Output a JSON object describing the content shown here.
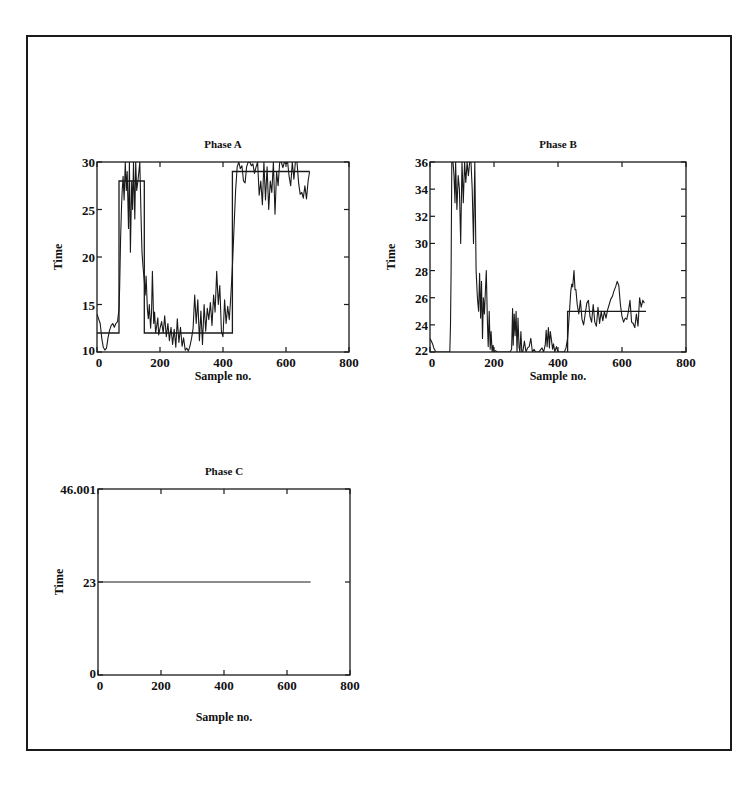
{
  "page": {
    "figure_title_partial": "Figure: Phase responses"
  },
  "chart_data": [
    {
      "type": "line",
      "id": "phaseA",
      "title": "Phase A",
      "xlabel": "Sample no.",
      "ylabel": "Time",
      "xlim": [
        0,
        800
      ],
      "ylim": [
        10,
        30
      ],
      "xticks": [
        0,
        200,
        400,
        600,
        800
      ],
      "yticks": [
        10,
        15,
        20,
        25,
        30
      ],
      "grid": false,
      "box": {
        "x0": 97,
        "y0": 162,
        "x1": 349,
        "y1": 352
      },
      "series": [
        {
          "name": "measured",
          "style": "noisy",
          "x": [
            0,
            5,
            10,
            15,
            20,
            25,
            30,
            35,
            40,
            45,
            50,
            55,
            60,
            65,
            70,
            72,
            75,
            78,
            80,
            83,
            86,
            90,
            93,
            96,
            100,
            103,
            106,
            110,
            113,
            116,
            120,
            123,
            126,
            130,
            133,
            136,
            140,
            143,
            146,
            150,
            153,
            156,
            160,
            163,
            166,
            170,
            173,
            176,
            180,
            183,
            186,
            190,
            193,
            196,
            200,
            205,
            210,
            215,
            220,
            225,
            230,
            235,
            240,
            245,
            250,
            255,
            260,
            265,
            270,
            275,
            280,
            285,
            290,
            295,
            300,
            305,
            310,
            315,
            320,
            325,
            330,
            335,
            340,
            345,
            350,
            355,
            360,
            365,
            370,
            375,
            380,
            385,
            390,
            395,
            400,
            405,
            410,
            415,
            420,
            425,
            430,
            435,
            440,
            445,
            450,
            455,
            460,
            465,
            470,
            475,
            480,
            485,
            490,
            495,
            500,
            505,
            510,
            515,
            520,
            525,
            530,
            535,
            540,
            545,
            550,
            555,
            560,
            565,
            570,
            575,
            580,
            585,
            590,
            595,
            600,
            605,
            610,
            615,
            620,
            625,
            630,
            635,
            640,
            645,
            650,
            655,
            660,
            665,
            670,
            675
          ],
          "y": [
            14,
            13.5,
            13,
            11.5,
            10.5,
            10.2,
            10.4,
            11.5,
            12.3,
            12.8,
            13,
            12.6,
            13,
            13.2,
            14.5,
            17,
            22,
            25.5,
            27,
            28.5,
            26,
            30,
            27,
            29,
            23,
            30,
            20.5,
            28,
            25,
            30,
            24,
            30,
            27,
            28,
            29,
            30,
            24,
            20.5,
            19,
            17.5,
            16,
            18,
            14.5,
            13.5,
            15,
            12.5,
            14,
            18.5,
            13,
            14.2,
            12,
            12.8,
            13.6,
            11.8,
            12.5,
            13.2,
            12,
            13.8,
            11.6,
            13,
            11.2,
            12.6,
            10.8,
            12.4,
            10.5,
            13.5,
            11,
            12.6,
            10.6,
            11.5,
            10.2,
            10.4,
            10.1,
            10.6,
            11.4,
            12.5,
            16,
            13,
            15.5,
            11.2,
            14.3,
            10.8,
            15,
            12.2,
            14.6,
            13.4,
            15.2,
            12.8,
            16,
            14.2,
            18.5,
            15,
            17,
            12.2,
            11.6,
            15.5,
            13,
            14.8,
            13.4,
            16,
            19,
            23,
            27,
            29.5,
            30,
            29.3,
            29.6,
            28,
            27.8,
            29.5,
            30,
            30,
            29.6,
            29.8,
            28.8,
            29.5,
            30,
            26.5,
            28,
            25.5,
            30,
            26,
            29.5,
            25,
            28,
            26.8,
            30,
            24.5,
            29,
            27.5,
            30,
            30,
            29.4,
            30,
            29.8,
            30,
            28.5,
            27.5,
            30,
            28.2,
            30,
            30,
            27.8,
            26.6,
            26.8,
            26.2,
            27.5,
            26.1,
            28,
            29,
            30
          ]
        },
        {
          "name": "setpoint",
          "style": "step",
          "x": [
            0,
            70,
            70,
            150,
            150,
            430,
            430,
            675
          ],
          "y": [
            12,
            12,
            28,
            28,
            12,
            12,
            29,
            29
          ]
        }
      ]
    },
    {
      "type": "line",
      "id": "phaseB",
      "title": "Phase B",
      "xlabel": "Sample no.",
      "ylabel": "Time",
      "xlim": [
        0,
        800
      ],
      "ylim": [
        22,
        36
      ],
      "xticks": [
        0,
        200,
        400,
        600,
        800
      ],
      "yticks": [
        22,
        24,
        26,
        28,
        30,
        32,
        34,
        36
      ],
      "grid": false,
      "box": {
        "x0": 430,
        "y0": 162,
        "x1": 686,
        "y1": 352
      },
      "series": [
        {
          "name": "measured",
          "style": "noisy",
          "x": [
            0,
            4,
            8,
            12,
            16,
            20,
            25,
            30,
            40,
            50,
            55,
            58,
            60,
            62,
            64,
            66,
            68,
            70,
            72,
            75,
            78,
            80,
            84,
            88,
            92,
            96,
            100,
            104,
            108,
            112,
            116,
            120,
            124,
            128,
            132,
            136,
            140,
            144,
            148,
            150,
            152,
            155,
            158,
            161,
            164,
            167,
            170,
            173,
            176,
            179,
            182,
            185,
            188,
            191,
            194,
            197,
            200,
            205,
            210,
            215,
            220,
            230,
            240,
            250,
            255,
            258,
            260,
            263,
            266,
            269,
            272,
            275,
            278,
            281,
            284,
            287,
            290,
            295,
            300,
            305,
            310,
            315,
            320,
            325,
            330,
            340,
            350,
            355,
            360,
            363,
            366,
            370,
            373,
            376,
            380,
            383,
            386,
            390,
            395,
            400,
            405,
            410,
            415,
            420,
            425,
            430,
            433,
            436,
            440,
            443,
            446,
            450,
            453,
            456,
            460,
            465,
            470,
            475,
            480,
            485,
            490,
            495,
            500,
            505,
            510,
            515,
            520,
            525,
            530,
            535,
            540,
            545,
            550,
            555,
            560,
            565,
            570,
            575,
            580,
            585,
            590,
            595,
            600,
            605,
            610,
            615,
            620,
            625,
            630,
            635,
            640,
            645,
            650,
            655,
            660,
            665,
            670,
            675
          ],
          "y": [
            23,
            22.8,
            22.6,
            22.3,
            22.1,
            22,
            22,
            22,
            22,
            22,
            22,
            22,
            22,
            22,
            24,
            28,
            36,
            36,
            36,
            35,
            33,
            36,
            32.5,
            35,
            34,
            30,
            36,
            33,
            36,
            34.5,
            36,
            35,
            36,
            36,
            34,
            30,
            36,
            28,
            26,
            25.5,
            25,
            27.8,
            24.5,
            27.2,
            23,
            26,
            24.8,
            26.5,
            28,
            24.5,
            22.4,
            25,
            22.2,
            23.5,
            22,
            22.5,
            22,
            22.1,
            22,
            22,
            22,
            22,
            22,
            22,
            22.2,
            25.2,
            22.5,
            24.8,
            23.2,
            25,
            22,
            24.5,
            22.4,
            22,
            23.5,
            22,
            22,
            22.8,
            22,
            22.3,
            22.4,
            23,
            22,
            22.2,
            22,
            22,
            22.3,
            22,
            22.5,
            23.6,
            22.4,
            23.8,
            22.3,
            23.5,
            22.8,
            22.2,
            22.6,
            22,
            22.4,
            22,
            22,
            22,
            22,
            22,
            22.3,
            23,
            24,
            25,
            26.5,
            27,
            26.8,
            28,
            26.6,
            26.6,
            25.5,
            24.8,
            25.8,
            24.4,
            24,
            24.8,
            25.6,
            25.8,
            24.6,
            24.2,
            25.5,
            24.2,
            23.9,
            25.3,
            24.1,
            25,
            24.3,
            25,
            24.5,
            25.1,
            25.5,
            25.9,
            26.1,
            26.5,
            26.8,
            27.2,
            26.9,
            25.5,
            24.6,
            24.2,
            24.5,
            24.4,
            25,
            25.8,
            24.2,
            24.1,
            23.8,
            24.8,
            23.9,
            26,
            25.3,
            25.8,
            25.6
          ]
        },
        {
          "name": "setpoint",
          "style": "step",
          "x": [
            430,
            430,
            675
          ],
          "y": [
            22,
            25,
            25
          ]
        }
      ]
    },
    {
      "type": "line",
      "id": "phaseC",
      "title": "Phase C",
      "xlabel": "Sample no.",
      "ylabel": "Time",
      "xlim": [
        0,
        800
      ],
      "ylim": [
        0,
        46.001
      ],
      "xticks": [
        0,
        200,
        400,
        600,
        800
      ],
      "yticks": [
        0,
        23,
        46.001
      ],
      "ytick_labels": [
        "0",
        "23",
        "46.001"
      ],
      "grid": false,
      "box": {
        "x0": 98,
        "y0": 489,
        "x1": 350,
        "y1": 675
      },
      "series": [
        {
          "name": "measured",
          "style": "flat",
          "x": [
            0,
            675
          ],
          "y": [
            23,
            23
          ]
        }
      ]
    }
  ]
}
